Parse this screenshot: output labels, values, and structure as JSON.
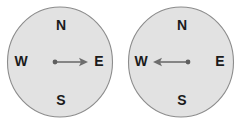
{
  "figure": {
    "background_color": "#ffffff",
    "dial_fill_color": "#e2e2e2",
    "dial_stroke_color": "#8c8c8c",
    "needle_color": "#6e6e6e",
    "label_color": "#1b1b1b",
    "compasses": [
      {
        "id": "compass-left",
        "needle_direction": "east",
        "needle_heading_degrees": 90,
        "cardinals": {
          "north": "N",
          "south": "S",
          "east": "E",
          "west": "W"
        }
      },
      {
        "id": "compass-right",
        "needle_direction": "west",
        "needle_heading_degrees": 270,
        "cardinals": {
          "north": "N",
          "south": "S",
          "east": "E",
          "west": "W"
        }
      }
    ]
  }
}
